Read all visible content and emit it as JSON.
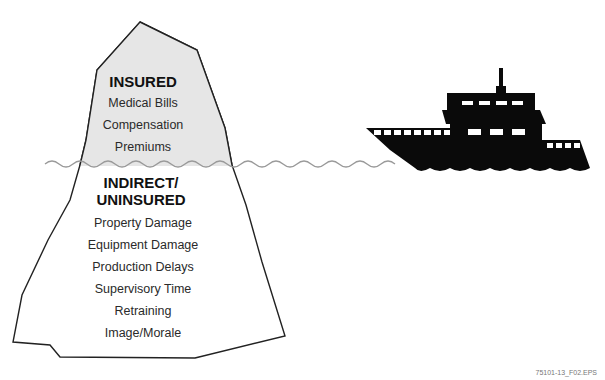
{
  "diagram": {
    "type": "iceberg-analogy",
    "above_water": {
      "heading": "INSURED",
      "items": [
        "Medical Bills",
        "Compensation",
        "Premiums"
      ]
    },
    "below_water": {
      "heading_line1": "INDIRECT/",
      "heading_line2": "UNINSURED",
      "items": [
        "Property Damage",
        "Equipment Damage",
        "Production Delays",
        "Supervisory Time",
        "Retraining",
        "Image/Morale"
      ]
    },
    "ship_icon": "ship-silhouette-icon",
    "colors": {
      "iceberg_above": "#e6e6e6",
      "iceberg_below": "#ffffff",
      "outline": "#222222",
      "water": "#9a9a9a",
      "ship": "#0a0a0a"
    }
  },
  "figure_id": "75101-13_F02.EPS"
}
